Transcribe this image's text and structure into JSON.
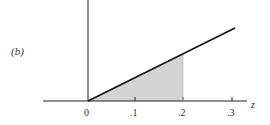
{
  "figure": {
    "panel_label": "(b)",
    "x_axis_label": "z",
    "tick_labels": [
      "0",
      ".1",
      ".2",
      ".3"
    ],
    "shaded_region": {
      "from": 0,
      "to": 0.2,
      "color": "#d3d3d3"
    },
    "line": {
      "from": [
        0,
        0
      ],
      "to": [
        0.31,
        "top"
      ],
      "color": "#111111"
    }
  }
}
